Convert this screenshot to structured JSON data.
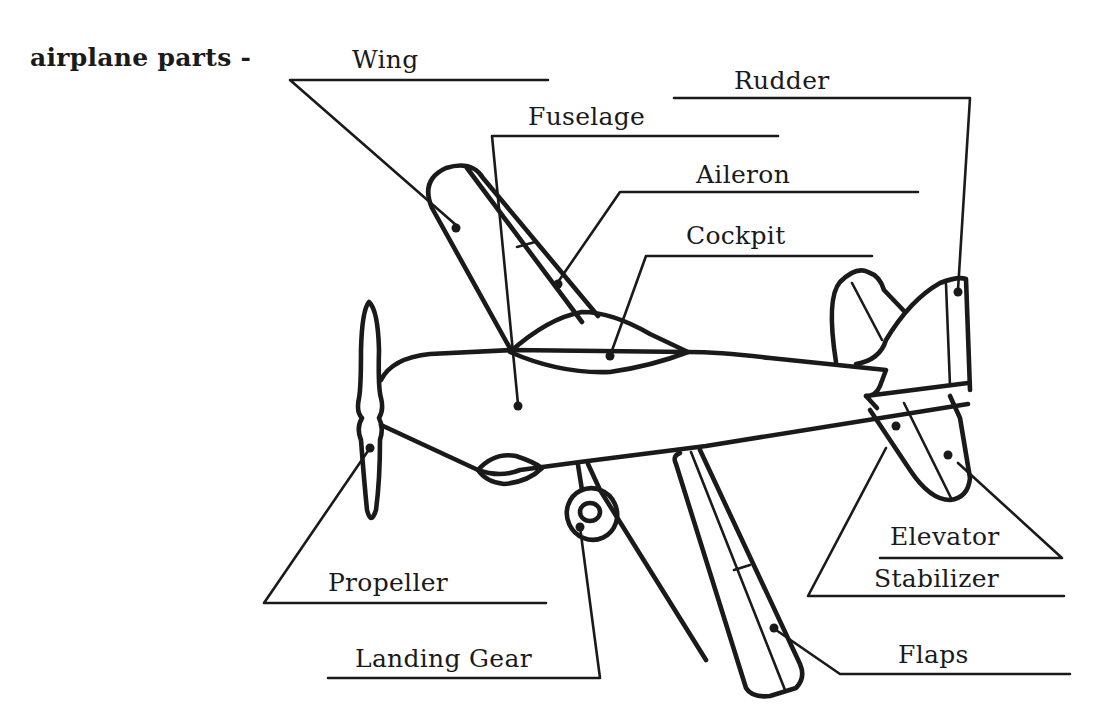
{
  "diagram": {
    "title": "airplane parts -",
    "subject": "airplane",
    "labels": [
      {
        "id": "wing",
        "text": "Wing"
      },
      {
        "id": "rudder",
        "text": "Rudder"
      },
      {
        "id": "fuselage",
        "text": "Fuselage"
      },
      {
        "id": "aileron",
        "text": "Aileron"
      },
      {
        "id": "cockpit",
        "text": "Cockpit"
      },
      {
        "id": "propeller",
        "text": "Propeller"
      },
      {
        "id": "landing_gear",
        "text": "Landing Gear"
      },
      {
        "id": "elevator",
        "text": "Elevator"
      },
      {
        "id": "stabilizer",
        "text": "Stabilizer"
      },
      {
        "id": "flaps",
        "text": "Flaps"
      }
    ],
    "colors": {
      "ink": "#1a1a1a",
      "background": "#ffffff"
    }
  }
}
